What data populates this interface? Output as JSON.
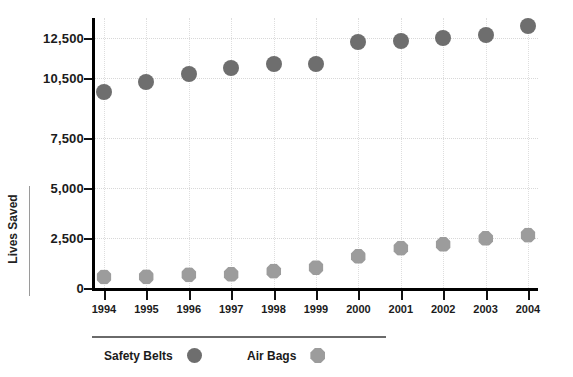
{
  "chart_data": {
    "type": "scatter",
    "title": "",
    "xlabel": "",
    "ylabel": "Lives Saved",
    "categories": [
      "1994",
      "1995",
      "1996",
      "1997",
      "1998",
      "1999",
      "2000",
      "2001",
      "2002",
      "2003",
      "2004"
    ],
    "ytick_labels": [
      "12,500",
      "10,500",
      "7,500",
      "5,000",
      "2,500",
      "0"
    ],
    "ytick_values": [
      12500,
      10500,
      7500,
      5000,
      2500,
      0
    ],
    "ylim": [
      0,
      13500
    ],
    "grid": true,
    "legend_position": "bottom-left",
    "series": [
      {
        "name": "Safety Belts",
        "marker": "circle",
        "color": "#6e6e6e",
        "values": [
          9800,
          10300,
          10700,
          11000,
          11200,
          11200,
          12300,
          12350,
          12500,
          12650,
          13100
        ]
      },
      {
        "name": "Air Bags",
        "marker": "octagon",
        "color": "#9c9c9c",
        "values": [
          550,
          560,
          660,
          680,
          840,
          1020,
          1580,
          1990,
          2180,
          2480,
          2640
        ]
      }
    ]
  },
  "legend": {
    "items": [
      {
        "label": "Safety Belts",
        "icon": "circle-marker-icon"
      },
      {
        "label": "Air Bags",
        "icon": "octagon-marker-icon"
      }
    ]
  },
  "axes": {
    "y_title": "Lives Saved"
  },
  "title_remnant": ""
}
